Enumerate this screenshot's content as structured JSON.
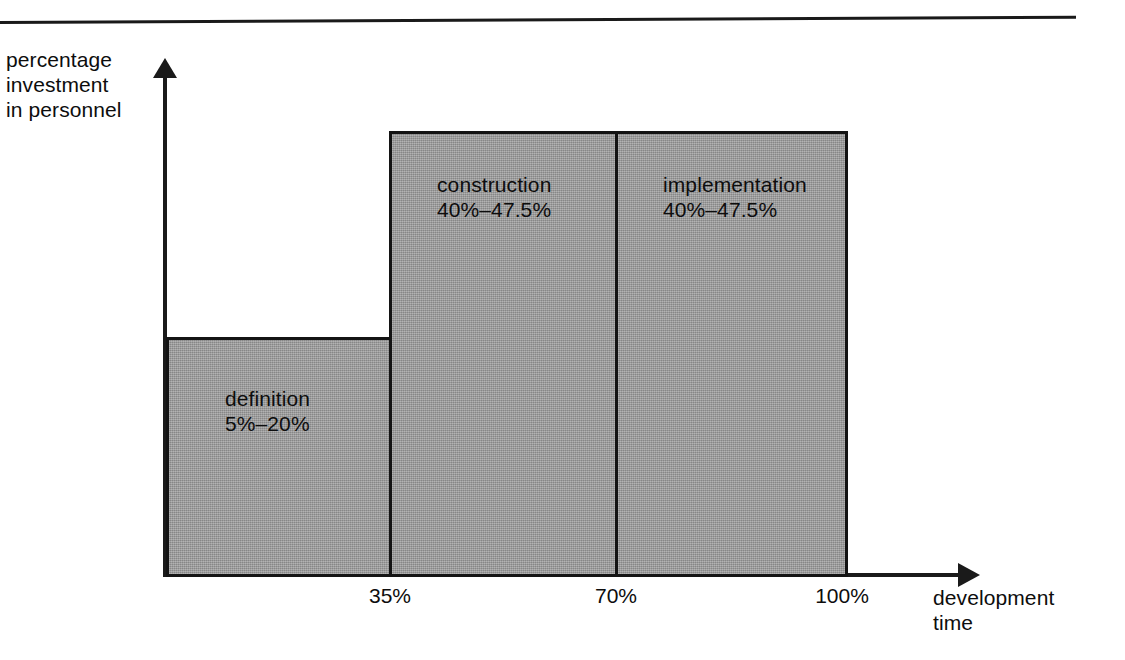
{
  "chart_data": {
    "type": "bar",
    "title": "",
    "xlabel": "development\ntime",
    "ylabel": "percentage\ninvestment\nin personnel",
    "categories": [
      "definition",
      "construction",
      "implementation"
    ],
    "x_tick_labels": [
      "35%",
      "70%",
      "100%"
    ],
    "x_tick_values": [
      35,
      70,
      100
    ],
    "x_segments": [
      {
        "name": "definition",
        "start": 0,
        "end": 35
      },
      {
        "name": "construction",
        "start": 35,
        "end": 70
      },
      {
        "name": "implementation",
        "start": 70,
        "end": 100
      }
    ],
    "values": [
      20,
      47.5,
      47.5
    ],
    "value_ranges": [
      {
        "min": 5,
        "max": 20
      },
      {
        "min": 40,
        "max": 47.5
      },
      {
        "min": 40,
        "max": 47.5
      }
    ],
    "bar_labels": [
      "definition\n5%–20%",
      "construction\n40%–47.5%",
      "implementation\n40%–47.5%"
    ],
    "grid": false,
    "legend": "none",
    "xlim": [
      0,
      100
    ],
    "ylim": [
      0,
      55
    ],
    "bar_fill_color": "#9a9a9a",
    "bar_border_color": "#141414",
    "axis_color": "#1a1a1a",
    "text_color": "#0d0d0d"
  },
  "axes": {
    "y_title": "percentage\ninvestment\nin personnel",
    "x_title": "development\ntime",
    "ticks": {
      "t0": "35%",
      "t1": "70%",
      "t2": "100%"
    }
  },
  "bars": {
    "definition": {
      "label": "definition\n5%–20%",
      "name": "definition",
      "range": "5%–20%"
    },
    "construction": {
      "label": "construction\n40%–47.5%",
      "name": "construction",
      "range": "40%–47.5%"
    },
    "implementation": {
      "label": "implementation\n40%–47.5%",
      "name": "implementation",
      "range": "40%–47.5%"
    }
  }
}
